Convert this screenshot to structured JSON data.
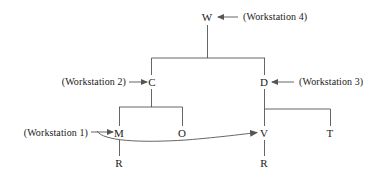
{
  "diagram": {
    "type": "tree-hierarchy-with-arc",
    "background_color": "#ffffff",
    "line_color": "#555555",
    "text_color": "#1a1a1a",
    "nodes": [
      {
        "id": "W",
        "label": "W",
        "x": 207,
        "y": 17
      },
      {
        "id": "C",
        "label": "C",
        "x": 152,
        "y": 82
      },
      {
        "id": "D",
        "label": "D",
        "x": 264,
        "y": 82
      },
      {
        "id": "M",
        "label": "M",
        "x": 119,
        "y": 133
      },
      {
        "id": "O",
        "label": "O",
        "x": 182,
        "y": 133
      },
      {
        "id": "V",
        "label": "V",
        "x": 264,
        "y": 133
      },
      {
        "id": "T",
        "label": "T",
        "x": 330,
        "y": 133
      },
      {
        "id": "R_left",
        "label": "R",
        "x": 119,
        "y": 163
      },
      {
        "id": "R_right",
        "label": "R",
        "x": 264,
        "y": 163
      }
    ],
    "edges": [
      {
        "from": "W",
        "to": "C",
        "style": "orthogonal"
      },
      {
        "from": "W",
        "to": "D",
        "style": "orthogonal"
      },
      {
        "from": "C",
        "to": "M",
        "style": "orthogonal"
      },
      {
        "from": "C",
        "to": "O",
        "style": "orthogonal"
      },
      {
        "from": "D",
        "to": "V",
        "style": "orthogonal"
      },
      {
        "from": "D",
        "to": "T",
        "style": "orthogonal"
      },
      {
        "from": "M",
        "to": "R_left",
        "style": "vertical"
      },
      {
        "from": "V",
        "to": "R_right",
        "style": "vertical"
      },
      {
        "from": "M",
        "to": "V",
        "style": "curved-arrow"
      }
    ],
    "annotations": [
      {
        "id": "ws4",
        "text": "(Workstation 4)",
        "target": "W",
        "arrow_direction": "left",
        "x": 243,
        "y": 17
      },
      {
        "id": "ws2",
        "text": "(Workstation 2)",
        "target": "C",
        "arrow_direction": "right",
        "x": 126,
        "y": 82
      },
      {
        "id": "ws3",
        "text": "(Workstation 3)",
        "target": "D",
        "arrow_direction": "left",
        "x": 297,
        "y": 82
      },
      {
        "id": "ws1",
        "text": "(Workstation 1)",
        "target": "M",
        "arrow_direction": "right",
        "x": 88,
        "y": 133
      }
    ]
  }
}
